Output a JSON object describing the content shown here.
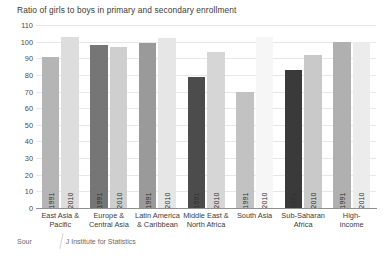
{
  "chart_data": {
    "type": "bar",
    "title": "Ratio of girls to boys in primary and secondary enrollment",
    "xlabel": "",
    "ylabel": "",
    "ylim": [
      0,
      110
    ],
    "yticks": [
      0,
      10,
      20,
      30,
      40,
      50,
      60,
      70,
      80,
      90,
      100,
      110
    ],
    "grid": true,
    "legend": "none",
    "categories": [
      "East Asia & Pacific",
      "Europe & Central Asia",
      "Latin America & Caribbean",
      "Middle East & North Africa",
      "South Asia",
      "Sub-Saharan Africa",
      "High-income"
    ],
    "category_lines": [
      [
        "East Asia &",
        "Pacific"
      ],
      [
        "Europe &",
        "Central Asia"
      ],
      [
        "Latin America",
        "& Caribbean"
      ],
      [
        "Middle East &",
        "North Africa"
      ],
      [
        "South Asia",
        ""
      ],
      [
        "Sub-Saharan",
        "Africa"
      ],
      [
        "High-",
        "income"
      ]
    ],
    "series": [
      {
        "name": "1991",
        "values": [
          91,
          98,
          99,
          79,
          70,
          83,
          100
        ],
        "colors": [
          "#b5b5b5",
          "#767676",
          "#9a9a9a",
          "#4c4c4c",
          "#c2c2c2",
          "#3a3a3a",
          "#b0b0b0"
        ]
      },
      {
        "name": "2010",
        "values": [
          103,
          97,
          102,
          94,
          103,
          92,
          100
        ],
        "colors": [
          "#dddddd",
          "#cfcfcf",
          "#e6e6e6",
          "#d6d6d6",
          "#f6f6f6",
          "#c9c9c9",
          "#ececec"
        ]
      }
    ]
  },
  "source": {
    "prefix": "Sour",
    "suffix": "J Institute for Statistics"
  }
}
